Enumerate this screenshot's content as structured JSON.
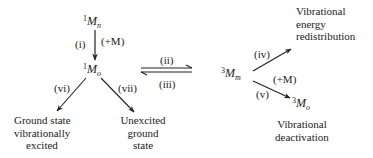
{
  "diagram": {
    "species": {
      "s1_m_n": {
        "sup": "1",
        "base": "M",
        "sub": "n"
      },
      "s1_m_o": {
        "sup": "1",
        "base": "M",
        "sub": "o"
      },
      "s3_m_m": {
        "sup": "3",
        "base": "M",
        "sub": "m"
      },
      "s3_m_o": {
        "sup": "3",
        "base": "M",
        "sub": "o"
      }
    },
    "steps": {
      "i": "(i)",
      "ii": "(ii)",
      "iii": "(iii)",
      "iv": "(iv)",
      "v": "(v)",
      "vi": "(vi)",
      "vii": "(vii)"
    },
    "collision_partner_1": "(+M)",
    "collision_partner_2": "(+M)",
    "outcomes": {
      "ground_vib_excited": [
        "Ground state",
        "vibrationally",
        "excited"
      ],
      "unexcited_ground": [
        "Unexcited",
        "ground",
        "state"
      ],
      "vib_energy_redistribution": [
        "Vibrational",
        "energy",
        "redistribution"
      ],
      "vib_deactivation": [
        "Vibrational",
        "deactivation"
      ]
    },
    "edges": [
      {
        "from": "1M_n",
        "to": "1M_o",
        "label": "(i)",
        "note": "(+M)"
      },
      {
        "from": "1M_o",
        "to": "3M_m",
        "label": "(ii)",
        "type": "forward"
      },
      {
        "from": "3M_m",
        "to": "1M_o",
        "label": "(iii)",
        "type": "reverse"
      },
      {
        "from": "3M_m",
        "to": "Vibrational energy redistribution",
        "label": "(iv)"
      },
      {
        "from": "3M_m",
        "to": "3M_o",
        "label": "(v)",
        "note": "(+M)"
      },
      {
        "from": "1M_o",
        "to": "Ground state vibrationally excited",
        "label": "(vi)"
      },
      {
        "from": "1M_o",
        "to": "Unexcited ground state",
        "label": "(vii)"
      }
    ],
    "colors": {
      "ink": "#222222",
      "background": "#ffffff"
    }
  }
}
